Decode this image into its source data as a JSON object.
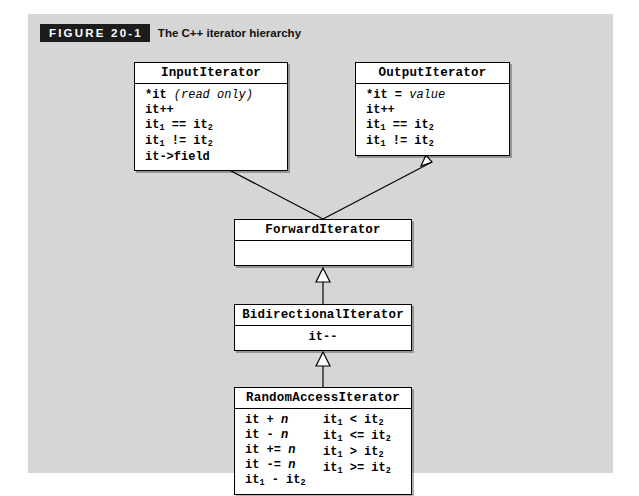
{
  "figure": {
    "tag": "FIGURE 20-1",
    "caption": "The C++ iterator hierarchy",
    "tag_bg": "#1c1c1c",
    "tag_fg": "#ffffff",
    "panel_bg": "#d6d6d6",
    "page_bg": "#ffffff"
  },
  "diagram": {
    "type": "uml-class-hierarchy",
    "relationship": "generalization",
    "arrowhead": "hollow-triangle",
    "boxes": [
      {
        "id": "input-iterator",
        "title": "InputIterator",
        "operations": [
          {
            "code": "*it",
            "note": "(read only)"
          },
          {
            "code": "it++",
            "note": ""
          },
          {
            "code": "it",
            "sub1": "1",
            "op": " == it",
            "sub2": "2",
            "note": ""
          },
          {
            "code": "it",
            "sub1": "1",
            "op": " != it",
            "sub2": "2",
            "note": ""
          },
          {
            "code": "it->field",
            "note": ""
          }
        ]
      },
      {
        "id": "output-iterator",
        "title": "OutputIterator",
        "operations": [
          {
            "code": "*it =",
            "note": "value"
          },
          {
            "code": "it++",
            "note": ""
          },
          {
            "code": "it",
            "sub1": "1",
            "op": " == it",
            "sub2": "2",
            "note": ""
          },
          {
            "code": "it",
            "sub1": "1",
            "op": " != it",
            "sub2": "2",
            "note": ""
          }
        ]
      },
      {
        "id": "forward-iterator",
        "title": "ForwardIterator",
        "operations": []
      },
      {
        "id": "bidirectional-iterator",
        "title": "BidirectionalIterator",
        "operations": [
          {
            "code": "it--",
            "note": ""
          }
        ]
      },
      {
        "id": "random-access-iterator",
        "title": "RandomAccessIterator",
        "operations_left": [
          "it + n",
          "it - n",
          "it += n",
          "it -= n",
          "it1 - it2"
        ],
        "operations_right": [
          "it1 < it2",
          "it1 <= it2",
          "it1 > it2",
          "it1 >= it2"
        ]
      }
    ],
    "edges": [
      {
        "from": "forward-iterator",
        "to": "input-iterator"
      },
      {
        "from": "forward-iterator",
        "to": "output-iterator"
      },
      {
        "from": "bidirectional-iterator",
        "to": "forward-iterator"
      },
      {
        "from": "random-access-iterator",
        "to": "bidirectional-iterator"
      }
    ]
  },
  "labels": {
    "input": {
      "title": "InputIterator",
      "r1_code": "*it",
      "r1_note": "(read only)",
      "r2": "it++",
      "r3_a": "it",
      "r3_s1": "1",
      "r3_b": " == it",
      "r3_s2": "2",
      "r4_a": "it",
      "r4_s1": "1",
      "r4_b": " != it",
      "r4_s2": "2",
      "r5": "it->field"
    },
    "output": {
      "title": "OutputIterator",
      "r1_code": "*it =",
      "r1_note": "value",
      "r2": "it++",
      "r3_a": "it",
      "r3_s1": "1",
      "r3_b": " == it",
      "r3_s2": "2",
      "r4_a": "it",
      "r4_s1": "1",
      "r4_b": " != it",
      "r4_s2": "2"
    },
    "forward": {
      "title": "ForwardIterator"
    },
    "bidirectional": {
      "title": "BidirectionalIterator",
      "r1": "it--"
    },
    "random": {
      "title": "RandomAccessIterator",
      "l1_a": "it + ",
      "l1_n": "n",
      "l2_a": "it - ",
      "l2_n": "n",
      "l3_a": "it += ",
      "l3_n": "n",
      "l4_a": "it -= ",
      "l4_n": "n",
      "l5_a": "it",
      "l5_s1": "1",
      "l5_b": " - it",
      "l5_s2": "2",
      "r1_a": "it",
      "r1_s1": "1",
      "r1_b": " < it",
      "r1_s2": "2",
      "r2_a": "it",
      "r2_s1": "1",
      "r2_b": " <= it",
      "r2_s2": "2",
      "r3_a": "it",
      "r3_s1": "1",
      "r3_b": " > it",
      "r3_s2": "2",
      "r4_a": "it",
      "r4_s1": "1",
      "r4_b": " >= it",
      "r4_s2": "2"
    }
  }
}
